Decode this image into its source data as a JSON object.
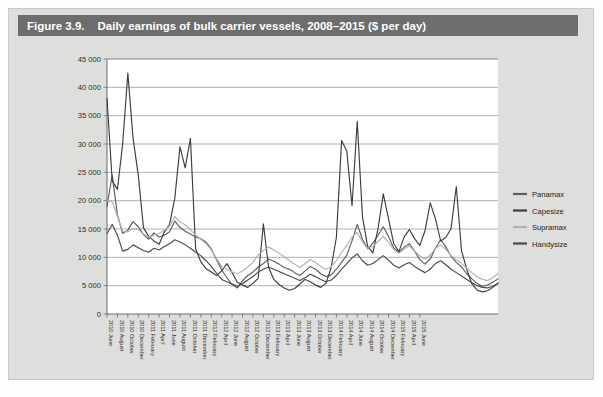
{
  "figure": {
    "number": "Figure 3.9.",
    "title": "Daily earnings of bulk carrier vessels, 2008–2015 ($ per day)",
    "header_bg": "#6d6d6d",
    "panel_bg": "#dededc",
    "plot_bg": "#ffffff"
  },
  "chart_data": {
    "type": "line",
    "title": "Daily earnings of bulk carrier vessels, 2008–2015 ($ per day)",
    "xlabel": "",
    "ylabel": "",
    "ylim": [
      0,
      45000
    ],
    "yticks": [
      0,
      5000,
      10000,
      15000,
      20000,
      25000,
      30000,
      35000,
      40000,
      45000
    ],
    "ytick_labels": [
      "0",
      "5 000",
      "10 000",
      "15 000",
      "20 000",
      "25 000",
      "30 000",
      "35 000",
      "40 000",
      "45 000"
    ],
    "grid": "horizontal",
    "legend_position": "right",
    "thousands_separator": "space",
    "x_tick_labels": [
      "2010 June",
      "2010 August",
      "2010 October",
      "2010 December",
      "2011 February",
      "2011 April",
      "2011 June",
      "2011 August",
      "2011 October",
      "2011 December",
      "2012 February",
      "2012 April",
      "2012 June",
      "2012 August",
      "2012 October",
      "2012 December",
      "2013 February",
      "2013 April",
      "2013 June",
      "2013 August",
      "2013 October",
      "2013 December",
      "2014 February",
      "2014 April",
      "2014 June",
      "2014 August",
      "2014 October",
      "2014 December",
      "2015 February",
      "2015 April",
      "2015 June"
    ],
    "x_tick_step_months": 2,
    "series": [
      {
        "name": "Panamax",
        "color": "#5e5e5e",
        "values": [
          19000,
          24500,
          17500,
          14200,
          14800,
          16300,
          15400,
          14000,
          13200,
          14300,
          13600,
          13900,
          14500,
          16400,
          15300,
          14600,
          14100,
          13600,
          13300,
          12700,
          11500,
          9600,
          7800,
          6400,
          5200,
          4600,
          5900,
          6800,
          7400,
          8300,
          8900,
          9700,
          9300,
          8800,
          8200,
          7900,
          7300,
          6800,
          7600,
          8400,
          7900,
          7100,
          6600,
          6900,
          7900,
          9100,
          10400,
          12900,
          15800,
          13200,
          11500,
          12500,
          13900,
          15400,
          13700,
          11600,
          10900,
          11800,
          12400,
          11100,
          9600,
          8800,
          9700,
          11600,
          13100,
          11800,
          10200,
          9100,
          8300,
          7100,
          6200,
          5400,
          4900,
          5100,
          5600,
          6200
        ]
      },
      {
        "name": "Capesize",
        "color": "#3d3d3d",
        "values": [
          38000,
          23500,
          22000,
          30000,
          42500,
          31000,
          24500,
          15200,
          13700,
          12900,
          12300,
          14500,
          15800,
          20400,
          29500,
          25800,
          31000,
          11500,
          9200,
          8000,
          7400,
          6800,
          7600,
          8900,
          7300,
          5600,
          5100,
          4700,
          5400,
          6300,
          15900,
          8200,
          6100,
          5200,
          4600,
          4200,
          4500,
          5300,
          6100,
          5700,
          5100,
          4700,
          5400,
          8200,
          13500,
          30600,
          28700,
          19100,
          34000,
          17200,
          11900,
          10800,
          15100,
          21200,
          16800,
          12400,
          11000,
          13600,
          14900,
          13300,
          12100,
          14700,
          19600,
          16800,
          12900,
          13500,
          15100,
          22500,
          11200,
          7900,
          5300,
          4200,
          3900,
          4100,
          4700,
          5500
        ]
      },
      {
        "name": "Supramax",
        "color": "#b0b0b0",
        "values": [
          20000,
          19800,
          17200,
          14600,
          14500,
          15100,
          14900,
          14100,
          13500,
          13900,
          14200,
          14800,
          15500,
          17200,
          16300,
          15700,
          14900,
          13900,
          13200,
          12400,
          11300,
          9800,
          8400,
          7900,
          7400,
          7100,
          7600,
          8300,
          9100,
          10400,
          11200,
          11800,
          11300,
          10700,
          10100,
          9400,
          8800,
          8200,
          8900,
          9600,
          9100,
          8400,
          7900,
          8300,
          9400,
          10900,
          12100,
          13600,
          14400,
          12700,
          11600,
          11900,
          12800,
          13700,
          12600,
          11400,
          10700,
          11500,
          12000,
          11100,
          10300,
          9700,
          10400,
          11600,
          12200,
          11400,
          10300,
          9600,
          8900,
          8100,
          7300,
          6600,
          6100,
          5900,
          6400,
          7100
        ]
      },
      {
        "name": "Handysize",
        "color": "#4a4a4a",
        "values": [
          14200,
          15800,
          13900,
          11100,
          11400,
          12200,
          11700,
          11200,
          10900,
          11600,
          11300,
          11900,
          12400,
          13100,
          12700,
          12200,
          11600,
          10900,
          10300,
          9400,
          8400,
          7200,
          6100,
          5700,
          5300,
          4900,
          5400,
          6000,
          6600,
          7400,
          7900,
          8300,
          7900,
          7500,
          7100,
          6700,
          6300,
          5900,
          6400,
          7000,
          6600,
          6100,
          5700,
          6000,
          6800,
          7900,
          8900,
          9900,
          10600,
          9400,
          8600,
          8900,
          9600,
          10300,
          9500,
          8600,
          8100,
          8700,
          9100,
          8400,
          7800,
          7300,
          7900,
          8900,
          9400,
          8700,
          7900,
          7300,
          6700,
          6100,
          5500,
          5000,
          4700,
          4600,
          4900,
          5400
        ]
      }
    ]
  },
  "legend": {
    "items": [
      {
        "label": "Panamax",
        "color": "#5e5e5e"
      },
      {
        "label": "Capesize",
        "color": "#3d3d3d"
      },
      {
        "label": "Supramax",
        "color": "#b0b0b0"
      },
      {
        "label": "Handysize",
        "color": "#4a4a4a"
      }
    ]
  }
}
